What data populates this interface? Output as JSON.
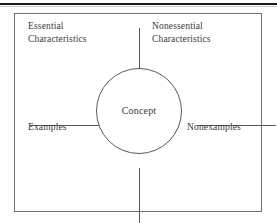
{
  "diagram": {
    "type": "frayer-model",
    "center": {
      "label": "Concept"
    },
    "quadrants": [
      {
        "position": "top-left",
        "label": "Essential\nCharacteristics"
      },
      {
        "position": "top-right",
        "label": "Nonessential\nCharacteristics"
      },
      {
        "position": "bottom-left",
        "label": "Examples"
      },
      {
        "position": "bottom-right",
        "label": "Nonexamples"
      }
    ],
    "colors": {
      "background": "#ffffff",
      "text": "#3a3a3a",
      "box_border": "#6f6f6f",
      "divider": "#5a5a5a",
      "top_rule": "#1a1a1a"
    }
  }
}
